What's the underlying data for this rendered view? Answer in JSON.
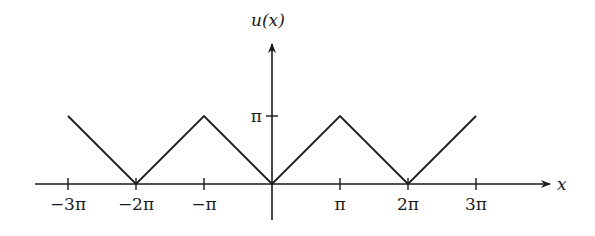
{
  "chart_data": {
    "type": "line",
    "title": "",
    "xlabel": "x",
    "ylabel": "u(x)",
    "x": [
      -9.42478,
      -6.28319,
      -3.14159,
      0,
      3.14159,
      6.28319,
      9.42478
    ],
    "series": [
      {
        "name": "u(x)",
        "values": [
          3.14159,
          0,
          3.14159,
          0,
          3.14159,
          0,
          3.14159
        ]
      }
    ],
    "xlim": [
      -10.2,
      12.8
    ],
    "ylim": [
      -1.6,
      5.8
    ],
    "x_ticks": [
      {
        "value": -9.42478,
        "label": "−3π"
      },
      {
        "value": -6.28319,
        "label": "−2π"
      },
      {
        "value": -3.14159,
        "label": "−π"
      },
      {
        "value": 3.14159,
        "label": "π"
      },
      {
        "value": 6.28319,
        "label": "2π"
      },
      {
        "value": 9.42478,
        "label": "3π"
      }
    ],
    "y_ticks": [
      {
        "value": 3.14159,
        "label": "π"
      }
    ],
    "grid": false,
    "legend": null,
    "colors": {
      "line": "#1a1a1a",
      "axis": "#1a1a1a",
      "background": "#ffffff"
    }
  }
}
